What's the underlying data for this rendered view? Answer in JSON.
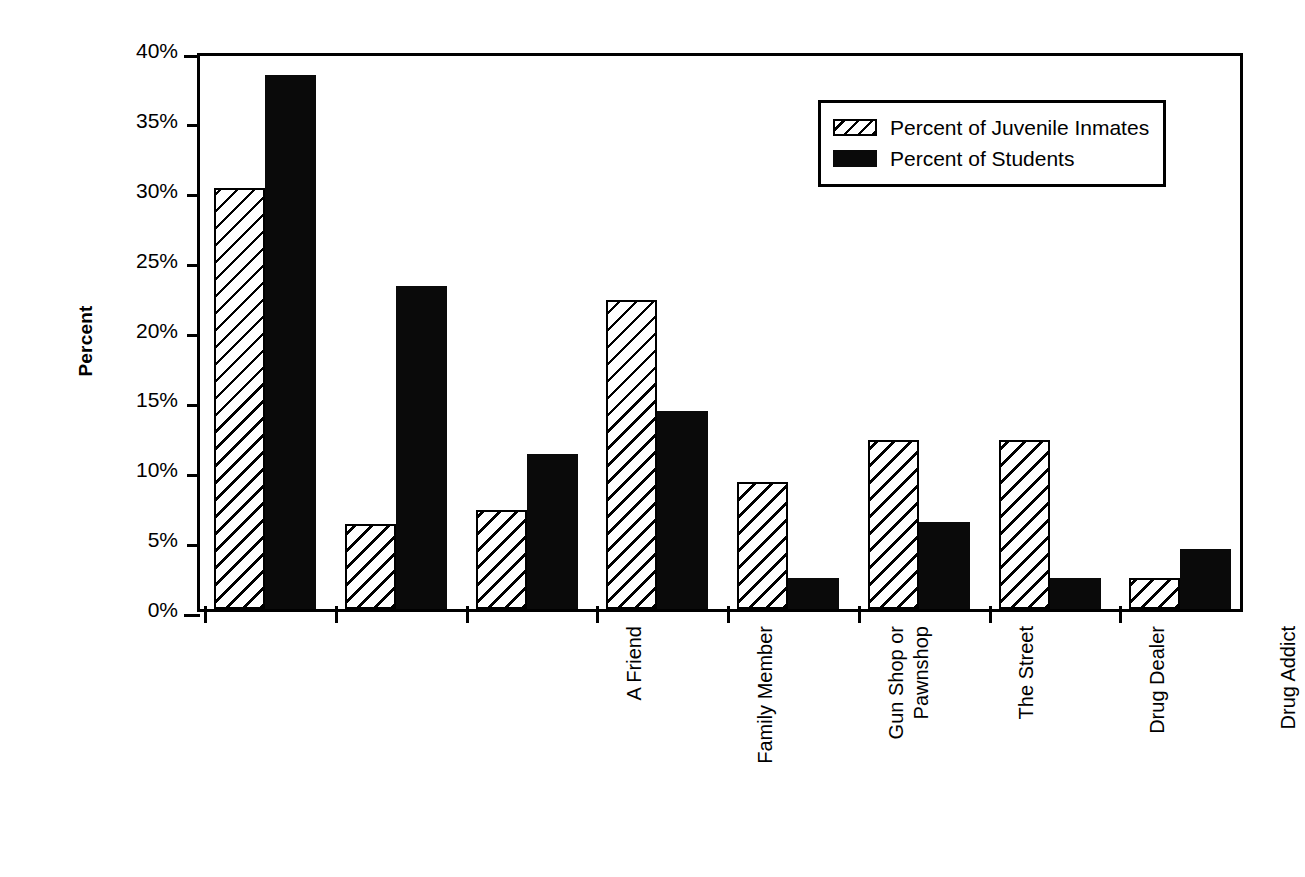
{
  "chart_data": {
    "type": "bar",
    "title": "",
    "xlabel": "",
    "ylabel": "Percent",
    "ylim": [
      0,
      40
    ],
    "ytick_labels": [
      "0%",
      "5%",
      "10%",
      "15%",
      "20%",
      "25%",
      "30%",
      "35%",
      "40%"
    ],
    "ytick_values": [
      0,
      5,
      10,
      15,
      20,
      25,
      30,
      35,
      40
    ],
    "grid": false,
    "legend_position": "upper right",
    "categories": [
      "A Friend",
      "Family Member",
      "Gun Shop or\nPawnshop",
      "The Street",
      "Drug Dealer",
      "Drug Addict",
      "Taken from\nSomeone's House\nor Car",
      "Other"
    ],
    "series": [
      {
        "name": "Percent of Juvenile Inmates",
        "fill": "hatched",
        "color": "#ffffff",
        "values": [
          30.1,
          6.1,
          7.1,
          22.1,
          9.1,
          12.1,
          12.1,
          2.2
        ]
      },
      {
        "name": "Percent of Students",
        "fill": "solid",
        "color": "#0a0a0a",
        "values": [
          38.2,
          23.1,
          11.1,
          14.2,
          2.2,
          6.2,
          2.2,
          4.3
        ]
      }
    ]
  },
  "legend": {
    "items": [
      {
        "label": "Percent of Juvenile Inmates",
        "swatch": "hatched"
      },
      {
        "label": "Percent of Students",
        "swatch": "solid"
      }
    ]
  },
  "axis": {
    "y_title": "Percent",
    "y_labels": [
      "40%",
      "35%",
      "30%",
      "25%",
      "20%",
      "15%",
      "10%",
      "5%",
      "0%"
    ]
  }
}
